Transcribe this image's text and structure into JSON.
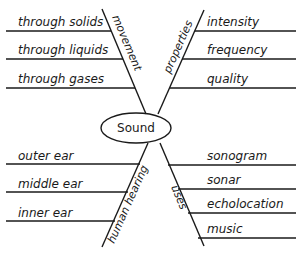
{
  "diagram": {
    "center": "Sound",
    "branches": [
      {
        "name": "movement",
        "items": [
          "through solids",
          "through liquids",
          "through gases"
        ]
      },
      {
        "name": "properties",
        "items": [
          "intensity",
          "frequency",
          "quality"
        ]
      },
      {
        "name": "human hearing",
        "items": [
          "outer ear",
          "middle ear",
          "inner ear"
        ]
      },
      {
        "name": "uses",
        "items": [
          "sonogram",
          "sonar",
          "echolocation",
          "music"
        ]
      }
    ]
  }
}
